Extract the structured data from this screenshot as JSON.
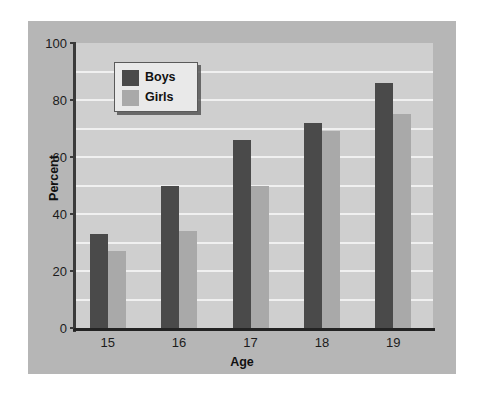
{
  "chart_data": {
    "type": "bar",
    "title": "",
    "xlabel": "Age",
    "ylabel": "Percent",
    "categories": [
      "15",
      "16",
      "17",
      "18",
      "19"
    ],
    "series": [
      {
        "name": "Boys",
        "color": "#4a4a4a",
        "values": [
          33,
          50,
          66,
          72,
          86
        ]
      },
      {
        "name": "Girls",
        "color": "#a9a9a9",
        "values": [
          27,
          34,
          50,
          69,
          75
        ]
      }
    ],
    "ylim": [
      0,
      100
    ],
    "yticks": [
      0,
      20,
      40,
      60,
      80,
      100
    ],
    "ytick_labels": [
      "0",
      "20",
      "40",
      "60",
      "80",
      "100"
    ],
    "gridlines": [
      10,
      20,
      30,
      40,
      50,
      60,
      70,
      80,
      90
    ],
    "grid": true,
    "grid_color": "#f0f0f0",
    "legend_position": "upper-left",
    "plot_background": "#cfcfcf",
    "figure_background": "#b6b6b6",
    "page_background": "#ffffff",
    "axis_color": "#2b2b2b"
  }
}
